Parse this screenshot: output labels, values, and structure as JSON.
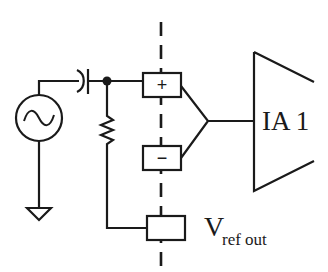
{
  "diagram": {
    "type": "circuit-schematic",
    "colors": {
      "line": "#1a1a1a",
      "background": "#ffffff"
    },
    "components": {
      "source": {
        "kind": "ac-voltage-source",
        "symbol": "~"
      },
      "capacitor": {
        "kind": "coupling-capacitor"
      },
      "resistor": {
        "kind": "bias-resistor"
      },
      "ground": {
        "kind": "ground"
      },
      "node": {
        "kind": "junction-dot"
      },
      "plus_input": {
        "kind": "input-box",
        "sign": "+"
      },
      "minus_input": {
        "kind": "input-box",
        "sign": "−"
      },
      "ref_box": {
        "kind": "reference-box"
      },
      "amplifier": {
        "kind": "instrumentation-amplifier",
        "label": "IA 1"
      }
    },
    "labels": {
      "amplifier": "IA 1",
      "vref_main": "V",
      "vref_sub": "ref out"
    },
    "divider": {
      "style": "dashed-vertical"
    }
  }
}
